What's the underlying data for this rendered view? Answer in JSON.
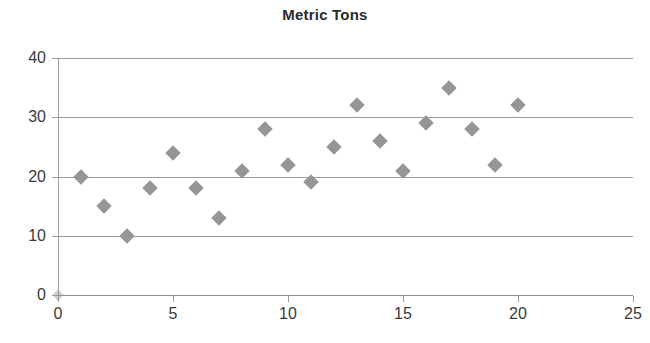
{
  "chart_data": {
    "type": "scatter",
    "title": "Metric Tons",
    "xlabel": "",
    "ylabel": "",
    "xlim": [
      0,
      25
    ],
    "ylim": [
      0,
      40
    ],
    "xticks": [
      0,
      5,
      10,
      15,
      20,
      25
    ],
    "yticks": [
      0,
      10,
      20,
      30,
      40
    ],
    "grid": "horizontal",
    "legend": "none",
    "marker": "diamond",
    "marker_color": "#969696",
    "series": [
      {
        "name": "Metric Tons",
        "points": [
          {
            "x": 0,
            "y": 0
          },
          {
            "x": 1,
            "y": 20
          },
          {
            "x": 2,
            "y": 15
          },
          {
            "x": 3,
            "y": 10
          },
          {
            "x": 4,
            "y": 18
          },
          {
            "x": 5,
            "y": 24
          },
          {
            "x": 6,
            "y": 18
          },
          {
            "x": 7,
            "y": 13
          },
          {
            "x": 8,
            "y": 21
          },
          {
            "x": 9,
            "y": 28
          },
          {
            "x": 10,
            "y": 22
          },
          {
            "x": 11,
            "y": 19
          },
          {
            "x": 12,
            "y": 25
          },
          {
            "x": 13,
            "y": 32
          },
          {
            "x": 14,
            "y": 26
          },
          {
            "x": 15,
            "y": 21
          },
          {
            "x": 16,
            "y": 29
          },
          {
            "x": 17,
            "y": 35
          },
          {
            "x": 18,
            "y": 28
          },
          {
            "x": 19,
            "y": 22
          },
          {
            "x": 20,
            "y": 32
          }
        ]
      }
    ]
  },
  "axis": {
    "y_tick_labels": [
      "40",
      "30",
      "20",
      "10",
      "0"
    ],
    "x_tick_labels": [
      "0",
      "5",
      "10",
      "15",
      "20",
      "25"
    ]
  },
  "colors": {
    "marker": "#969696",
    "gridline": "#9b9b9b",
    "axis": "#9b9b9b",
    "title": "#2b2b2b",
    "tick_text": "#3a3a3a",
    "background": "#ffffff"
  }
}
